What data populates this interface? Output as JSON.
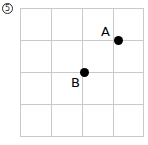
{
  "figure": {
    "badge": {
      "icon": "circled-number-icon",
      "number": "5"
    },
    "width": 148,
    "height": 145,
    "background_color": "#ffffff"
  },
  "chart_data": {
    "type": "scatter",
    "title": "",
    "xlabel": "",
    "ylabel": "",
    "grid": true,
    "grid_color": "#c9c9c9",
    "legend": "none",
    "xlim": [
      0,
      4
    ],
    "ylim": [
      0,
      4
    ],
    "xticks": [
      0,
      1,
      2,
      3,
      4
    ],
    "yticks": [
      0,
      1,
      2,
      3,
      4
    ],
    "xticklabels": [
      "",
      "",
      "",
      "",
      ""
    ],
    "yticklabels": [
      "",
      "",
      "",
      "",
      ""
    ],
    "point_color": "#000000",
    "points": [
      {
        "label": "A",
        "x": 3.16,
        "y": 3.0,
        "px": 118,
        "py": 40,
        "label_px": 101,
        "label_py": 25
      },
      {
        "label": "B",
        "x": 2.0,
        "y": 2.0,
        "px": 84,
        "py": 72,
        "label_px": 71,
        "label_py": 76
      }
    ],
    "grid_geometry": {
      "vertical_lines_px": [
        20,
        51,
        82,
        113,
        143
      ],
      "horizontal_lines_px": [
        8,
        40,
        72,
        104,
        136
      ]
    }
  }
}
